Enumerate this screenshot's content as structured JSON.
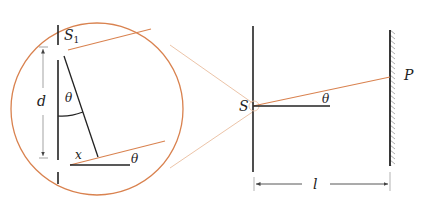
{
  "diagram": {
    "type": "double-slit geometry with magnified inset",
    "labels": {
      "slit1": "S",
      "slit1_sub": "1",
      "slit_separation": "d",
      "angle_inset_top": "θ",
      "path_difference": "x",
      "angle_inset_bottom": "θ",
      "source": "S",
      "angle_main": "θ",
      "point": "P",
      "distance": "l"
    },
    "colors": {
      "ray": "#d9824f",
      "ray_faint": "#ecc4a8",
      "wall": "#222222",
      "circle": "#d9824f",
      "dimension": "#999999"
    }
  }
}
